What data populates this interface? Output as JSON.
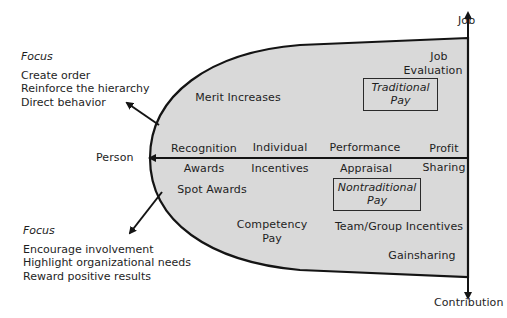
{
  "axes": {
    "job": "Job",
    "contribution": "Contribution",
    "person": "Person"
  },
  "focus_top": {
    "title": "Focus",
    "items": [
      "Create order",
      "Reinforce the hierarchy",
      "Direct behavior"
    ]
  },
  "focus_bottom": {
    "title": "Focus",
    "items": [
      "Encourage involvement",
      "Highlight organizational needs",
      "Reward positive results"
    ]
  },
  "upper_region": {
    "merit": "Merit Increases",
    "job_eval_1": "Job",
    "job_eval_2": "Evaluation",
    "traditional_1": "Traditional",
    "traditional_2": "Pay"
  },
  "axis_labels": {
    "recognition": "Recognition",
    "awards": "Awards",
    "individual": "Individual",
    "incentives": "Incentives",
    "performance": "Performance",
    "appraisal": "Appraisal",
    "profit": "Profit",
    "sharing": "Sharing"
  },
  "lower_region": {
    "spot_awards": "Spot Awards",
    "nontraditional_1": "Nontraditional",
    "nontraditional_2": "Pay",
    "competency_1": "Competency",
    "competency_2": "Pay",
    "team": "Team/Group Incentives",
    "gainsharing": "Gainsharing"
  },
  "colors": {
    "fill": "#d9d9d9",
    "stroke": "#141414",
    "text": "#1e1e1e"
  }
}
